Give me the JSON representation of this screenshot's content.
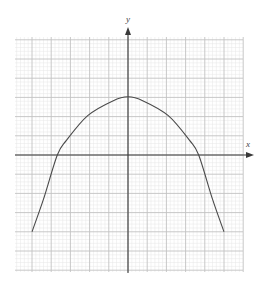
{
  "chart_data": {
    "type": "line",
    "title": "",
    "xlabel": "x",
    "ylabel": "y",
    "xlim": [
      -6,
      6
    ],
    "ylim": [
      -6,
      6
    ],
    "grid": {
      "on": true,
      "major_step": 1,
      "minor_per_major": 5
    },
    "tick_labels": {
      "x": [],
      "y": []
    },
    "legend": [],
    "series": [
      {
        "name": "curve",
        "description": "Downward-opening parabola-like curve, vertex on y-axis",
        "x": [
          -5.0,
          -4.4,
          -3.68,
          -3.2,
          -2.1,
          -0.79,
          0,
          0.79,
          2.1,
          3.2,
          3.68,
          4.4,
          5.0
        ],
        "y": [
          -4.0,
          -2.3,
          0.0,
          0.77,
          2.05,
          2.82,
          3.03,
          2.82,
          2.05,
          0.77,
          0.0,
          -2.3,
          -4.0
        ]
      }
    ]
  },
  "layout": {
    "origin_px": [
      128,
      155
    ],
    "unit_px": 19.2,
    "grid_left": 15,
    "grid_top": 37,
    "grid_right": 243,
    "grid_bottom": 272,
    "colors": {
      "minor": "#e6e6e6",
      "major": "#c2c2c2",
      "axis": "#3a3a3a",
      "curve": "#4a4a4a"
    }
  },
  "labels": {
    "x_axis": "x",
    "y_axis": "y"
  }
}
